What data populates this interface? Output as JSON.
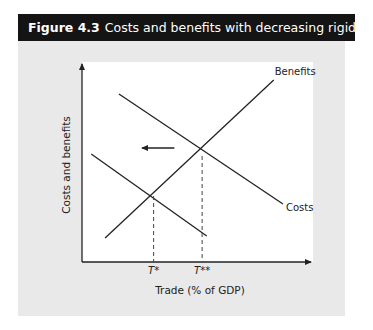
{
  "figure": {
    "number": "Figure 4.3",
    "title": "Costs and benefits with decreasing rigidities"
  },
  "chart_data": {
    "type": "line",
    "title": "Costs and benefits with decreasing rigidities",
    "xlabel": "Trade (% of GDP)",
    "ylabel": "Costs and benefits",
    "xlim": [
      0,
      100
    ],
    "ylim": [
      0,
      100
    ],
    "grid": false,
    "series": [
      {
        "name": "Benefits",
        "label": "Benefits",
        "style": "solid",
        "points": [
          [
            10,
            12
          ],
          [
            83,
            91
          ]
        ]
      },
      {
        "name": "Costs",
        "label": "Costs",
        "style": "solid",
        "points": [
          [
            16,
            84
          ],
          [
            87,
            29
          ]
        ]
      },
      {
        "name": "Costs (decreased rigidities)",
        "label": "",
        "style": "solid",
        "points": [
          [
            4,
            54
          ],
          [
            54,
            13
          ]
        ]
      }
    ],
    "reference_lines": [
      {
        "name": "T*",
        "x": 31,
        "y_top": 33,
        "style": "dashed"
      },
      {
        "name": "T**",
        "x": 52,
        "y_top": 53,
        "style": "dashed"
      }
    ],
    "x_tick_labels": [
      "T*",
      "T**"
    ],
    "annotations": [
      {
        "type": "arrow",
        "direction": "left",
        "meaning": "shift of costs curve",
        "from": [
          40,
          57
        ],
        "to": [
          26,
          57
        ]
      }
    ]
  }
}
